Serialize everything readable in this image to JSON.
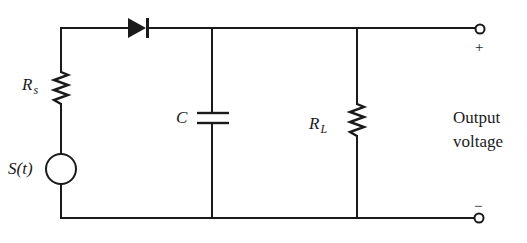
{
  "diagram": {
    "type": "circuit-schematic",
    "colors": {
      "line": "#1a1a1a",
      "background": "#ffffff"
    },
    "components": {
      "source": {
        "label": "S(t)",
        "symbol": "ac-source-circle"
      },
      "source_resistor": {
        "label_main": "R",
        "label_sub": "s",
        "symbol": "resistor"
      },
      "diode": {
        "symbol": "diode",
        "orientation": "pointing-right"
      },
      "capacitor": {
        "label": "C",
        "symbol": "capacitor"
      },
      "load_resistor": {
        "label_main": "R",
        "label_sub": "L",
        "symbol": "resistor"
      }
    },
    "output": {
      "label_line1": "Output",
      "label_line2": "voltage",
      "plus": "+",
      "minus": "−"
    }
  }
}
